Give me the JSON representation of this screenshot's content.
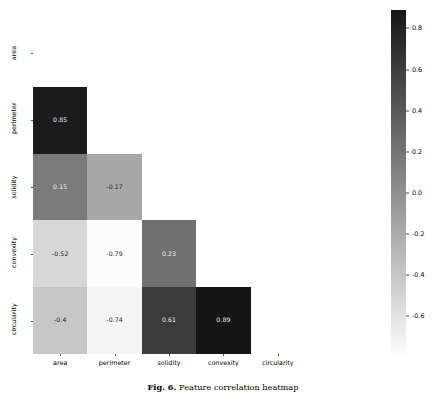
{
  "figure": {
    "caption_label": "Fig. 6.",
    "caption_text": "Feature correlation heatmap"
  },
  "chart_data": {
    "type": "heatmap",
    "title": "",
    "xlabel": "",
    "ylabel": "",
    "grid": false,
    "legend_position": "right",
    "colormap": "greys",
    "triangle": "lower",
    "categories": [
      "area",
      "perimeter",
      "solidity",
      "convexity",
      "circularity"
    ],
    "x_tick_labels": [
      "area",
      "perimeter",
      "solidity",
      "convexity",
      "circularity"
    ],
    "y_tick_labels": [
      "area",
      "perimeter",
      "solidity",
      "convexity",
      "circularity"
    ],
    "colorbar": {
      "ticks": [
        "0.8",
        "0.6",
        "0.4",
        "0.2",
        "0.0",
        "-0.2",
        "-0.4",
        "-0.6"
      ],
      "tick_values": [
        0.8,
        0.6,
        0.4,
        0.2,
        0.0,
        -0.2,
        -0.4,
        -0.6
      ],
      "vmin": -0.79,
      "vmax": 0.89
    },
    "matrix": [
      [
        null,
        null,
        null,
        null,
        null
      ],
      [
        0.85,
        null,
        null,
        null,
        null
      ],
      [
        0.15,
        -0.17,
        null,
        null,
        null
      ],
      [
        -0.52,
        -0.79,
        0.23,
        null,
        null
      ],
      [
        -0.4,
        -0.74,
        0.61,
        0.89,
        null
      ]
    ],
    "cells": [
      {
        "row": 1,
        "col": 0,
        "row_label": "perimeter",
        "col_label": "area",
        "value": 0.85,
        "text": "0.85"
      },
      {
        "row": 2,
        "col": 0,
        "row_label": "solidity",
        "col_label": "area",
        "value": 0.15,
        "text": "0.15"
      },
      {
        "row": 2,
        "col": 1,
        "row_label": "solidity",
        "col_label": "perimeter",
        "value": -0.17,
        "text": "-0.17"
      },
      {
        "row": 3,
        "col": 0,
        "row_label": "convexity",
        "col_label": "area",
        "value": -0.52,
        "text": "-0.52"
      },
      {
        "row": 3,
        "col": 1,
        "row_label": "convexity",
        "col_label": "perimeter",
        "value": -0.79,
        "text": "-0.79"
      },
      {
        "row": 3,
        "col": 2,
        "row_label": "convexity",
        "col_label": "solidity",
        "value": 0.23,
        "text": "0.23"
      },
      {
        "row": 4,
        "col": 0,
        "row_label": "circularity",
        "col_label": "area",
        "value": -0.4,
        "text": "-0.4"
      },
      {
        "row": 4,
        "col": 1,
        "row_label": "circularity",
        "col_label": "perimeter",
        "value": -0.74,
        "text": "-0.74"
      },
      {
        "row": 4,
        "col": 2,
        "row_label": "circularity",
        "col_label": "solidity",
        "value": 0.61,
        "text": "0.61"
      },
      {
        "row": 4,
        "col": 3,
        "row_label": "circularity",
        "col_label": "convexity",
        "value": 0.89,
        "text": "0.89"
      }
    ]
  }
}
